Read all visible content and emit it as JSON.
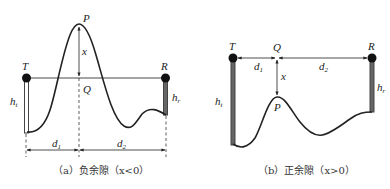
{
  "figure_a": {
    "caption": "（a）负余隙（x<0）",
    "labels": {
      "T": "T",
      "R": "R",
      "P": "P",
      "Q": "Q",
      "x": "x",
      "ht": "h",
      "ht_sub": "t",
      "hr": "h",
      "hr_sub": "r",
      "d1": "d",
      "d1_sub": "1",
      "d2": "d",
      "d2_sub": "2"
    }
  },
  "figure_b": {
    "caption": "（b）正余隙（x>0）",
    "labels": {
      "T": "T",
      "R": "R",
      "P": "P",
      "Q": "Q",
      "x": "x",
      "ht": "h",
      "ht_sub": "t",
      "hr": "h",
      "hr_sub": "r",
      "d1": "d",
      "d1_sub": "1",
      "d2": "d",
      "d2_sub": "2"
    }
  },
  "colors": {
    "line": "#222222",
    "mast": "#555555",
    "text": "#222222"
  }
}
